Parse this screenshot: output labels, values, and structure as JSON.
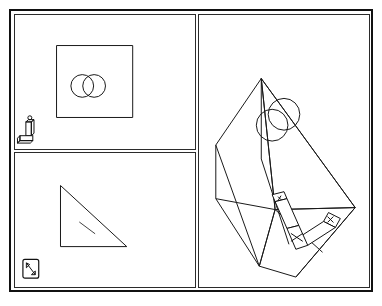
{
  "app": {
    "title": "CAD Multi-View Viewport",
    "background_color": "#ffffff",
    "line_color": "#1a1a1a",
    "border_color": "#111111"
  },
  "layout": {
    "canvas_width": 382,
    "canvas_height": 306,
    "outer_border_thickness": 2,
    "panel_count": 3,
    "panel_divider_vertical_x": 192,
    "panel_divider_horizontal_y": 149
  },
  "panels": [
    {
      "id": "panel-top-left",
      "name": "orthographic-front-view",
      "label": "Front View",
      "projection": "orthographic",
      "geometry": [
        {
          "type": "rectangle",
          "name": "square-outline",
          "x": 44,
          "y": 42,
          "width": 75,
          "height": 72
        },
        {
          "type": "circle",
          "name": "bore-circle-left",
          "cx": 70,
          "cy": 82,
          "r": 11
        },
        {
          "type": "circle",
          "name": "bore-circle-right",
          "cx": 82,
          "cy": 82,
          "r": 11
        }
      ],
      "widget": {
        "name": "axis-gizmo",
        "position": "bottom-left",
        "x": 16,
        "y": 116
      }
    },
    {
      "id": "panel-bottom-left",
      "name": "orthographic-side-view",
      "label": "Side View",
      "projection": "orthographic",
      "geometry": [
        {
          "type": "triangle",
          "name": "right-triangle-profile",
          "points": "49,185 49,245 116,245"
        },
        {
          "type": "line",
          "name": "interior-hatch-line",
          "x1": 68,
          "y1": 222,
          "x2": 84,
          "y2": 233
        }
      ],
      "widget": {
        "name": "view-navigation-icon",
        "position": "bottom-left",
        "x": 14,
        "y": 262
      }
    },
    {
      "id": "panel-right",
      "name": "isometric-3d-view",
      "label": "3D Perspective View",
      "projection": "isometric",
      "geometry": [
        {
          "type": "wireframe-solid",
          "name": "wedge-prism-body",
          "description": "wedge / triangular prism shown in isometric wireframe"
        },
        {
          "type": "circle",
          "name": "bore-circle-upper",
          "cx": 278,
          "cy": 157,
          "r": 16
        },
        {
          "type": "circle",
          "name": "bore-circle-lower",
          "cx": 269,
          "cy": 168,
          "r": 16
        }
      ],
      "widget": {
        "name": "transform-manipulator-gizmo",
        "position": "lower-center",
        "x": 268,
        "y": 228
      }
    }
  ],
  "status": {
    "active_panel": "panel-right",
    "units": "",
    "zoom_level": ""
  }
}
